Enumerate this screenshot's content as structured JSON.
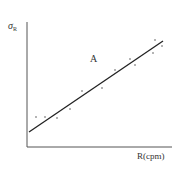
{
  "chart_data": {
    "type": "scatter",
    "title": "",
    "xlabel": "R(cpm)",
    "ylabel": "σR",
    "ylabel_main": "σ",
    "ylabel_sub": "R",
    "annotation": "A",
    "grid": false,
    "legend": null,
    "axis_ticks": "none",
    "points_px": [
      [
        36,
        117
      ],
      [
        45,
        117
      ],
      [
        57,
        118
      ],
      [
        70,
        109
      ],
      [
        82,
        91
      ],
      [
        102,
        88
      ],
      [
        115,
        70
      ],
      [
        130,
        59
      ],
      [
        135,
        65
      ],
      [
        153,
        53
      ],
      [
        155,
        40
      ],
      [
        162,
        46
      ]
    ],
    "fit_line_px": {
      "x1": 29,
      "y1": 132,
      "x2": 163,
      "y2": 41
    },
    "axes_px": {
      "origin_x": 27,
      "origin_y": 147,
      "y_top": 22,
      "x_right": 172
    },
    "trend": "linear increasing"
  }
}
